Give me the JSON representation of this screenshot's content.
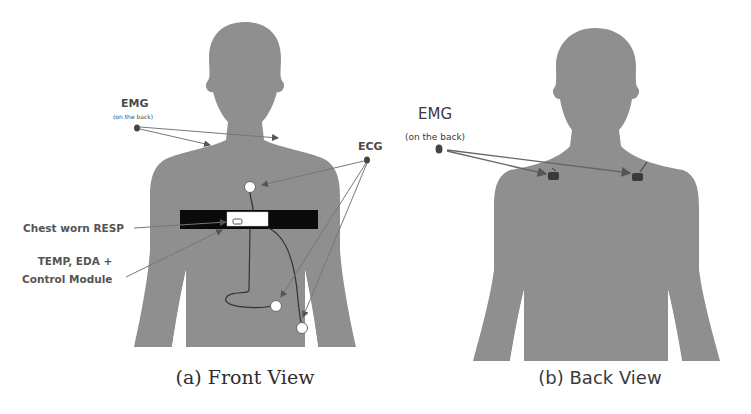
{
  "figure": {
    "panels": [
      {
        "id": "front",
        "caption": "(a) Front View",
        "labels": {
          "emg": "EMG",
          "emg_note": "(on the back)",
          "ecg": "ECG",
          "resp": "Chest worn RESP",
          "temp_line1": "TEMP, EDA +",
          "temp_line2": "Control Module"
        }
      },
      {
        "id": "back",
        "caption": "(b) Back View",
        "labels": {
          "emg": "EMG",
          "emg_note": "(on the back)"
        }
      }
    ],
    "colors": {
      "silhouette": "#8f8f8f",
      "strap": "#0a0a0a",
      "module": "#ffffff",
      "arrow": "#6e6e6e",
      "sensor_dot": "#444444",
      "electrode": "#ffffff"
    }
  }
}
